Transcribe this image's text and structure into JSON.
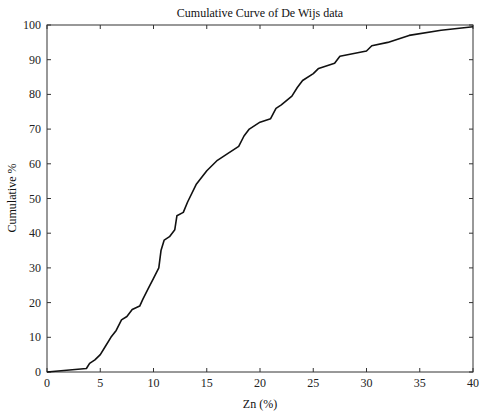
{
  "chart_data": {
    "type": "line",
    "title": "Cumulative Curve of De Wijs data",
    "xlabel": "Zn (%)",
    "ylabel": "Cumulative %",
    "xlim": [
      0,
      40
    ],
    "ylim": [
      0,
      100
    ],
    "xticks": [
      0,
      5,
      10,
      15,
      20,
      25,
      30,
      35,
      40
    ],
    "yticks": [
      0,
      10,
      20,
      30,
      40,
      50,
      60,
      70,
      80,
      90,
      100
    ],
    "grid": false,
    "legend": null,
    "series": [
      {
        "name": "Cumulative curve",
        "color": "#111111",
        "x": [
          0,
          3.7,
          4,
          4.5,
          5,
          5.5,
          6,
          6.5,
          7,
          7.5,
          8,
          8.7,
          9,
          9.5,
          10,
          10.5,
          10.7,
          11,
          11.5,
          12,
          12.2,
          12.8,
          13.2,
          14,
          15,
          16,
          17,
          18,
          18.5,
          19,
          20,
          21,
          21.5,
          22,
          23,
          23.5,
          24,
          25,
          25.5,
          27,
          27.5,
          30,
          30.5,
          32,
          34,
          37,
          40
        ],
        "y": [
          0,
          1,
          2.5,
          3.5,
          5,
          7.5,
          10,
          12,
          15,
          16,
          18,
          19,
          21,
          24,
          27,
          30,
          35,
          38,
          39,
          41,
          45,
          46,
          49,
          54,
          58,
          61,
          63,
          65,
          68,
          70,
          72,
          73,
          76,
          77,
          79.5,
          82,
          84,
          86,
          87.5,
          89,
          91,
          92.5,
          94,
          95,
          97,
          98.5,
          99.5
        ]
      }
    ]
  },
  "plot": {
    "left": 47,
    "right": 473,
    "top": 25,
    "bottom": 372
  }
}
